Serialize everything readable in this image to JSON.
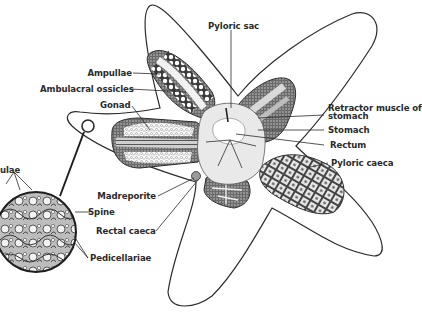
{
  "diagram": {
    "colors": {
      "ink": "#2b2b2b",
      "background": "#ffffff",
      "stipple": "#555555",
      "light_tissue": "#e8e8e8"
    },
    "labels": {
      "ampullae": "Ampullae",
      "ambulacral_ossicles": "Ambulacral ossicles",
      "gonad": "Gonad",
      "pyloric_sac": "Pyloric sac",
      "retractor_muscle_line1": "Retractor muscle of",
      "retractor_muscle_line2": "stomach",
      "stomach": "Stomach",
      "rectum": "Rectum",
      "pyloric_caeca": "Pyloric caeca",
      "madreporite": "Madreporite",
      "rectal_caeca": "Rectal caeca",
      "spine": "Spine",
      "pedicellariae": "Pedicellariae",
      "papulae_partial": "ulae"
    },
    "inset": {
      "description": "Magnified circular view of body-wall surface",
      "callouts": [
        "ulae",
        "Spine",
        "Pedicellariae"
      ]
    }
  }
}
